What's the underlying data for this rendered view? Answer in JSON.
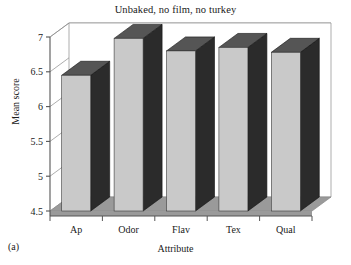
{
  "chart_data": {
    "type": "bar",
    "title": "Unbaked, no film, no turkey",
    "xlabel": "Attribute",
    "ylabel": "Mean score",
    "categories": [
      "Ap",
      "Odor",
      "Flav",
      "Tex",
      "Qual"
    ],
    "values": [
      6.45,
      6.98,
      6.8,
      6.85,
      6.78
    ],
    "ylim": [
      4.5,
      7.0
    ],
    "yticks": [
      4.5,
      5,
      5.5,
      6,
      6.5,
      7
    ],
    "ytick_labels": [
      "4.5",
      "5",
      "5.5",
      "6",
      "6.5",
      "7"
    ],
    "grid": true,
    "legend": false,
    "style": "3d-column",
    "panel_label": "(a)",
    "colors": {
      "bar_front": "#c9c9c9",
      "bar_side": "#2b2b2b",
      "bar_top": "#555555",
      "floor": "#9a9a9a",
      "back_wall": "#ffffff",
      "axis": "#555555",
      "grid": "#8a8a8a",
      "text": "#1a1a1a"
    }
  }
}
